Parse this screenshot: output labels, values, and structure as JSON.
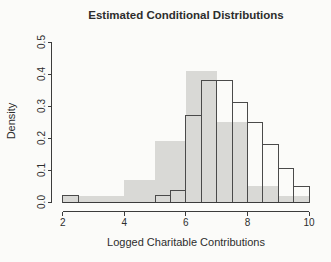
{
  "chart_data": {
    "type": "bar",
    "subtype": "overlaid-histograms",
    "title": "Estimated Conditional Distributions",
    "xlabel": "Logged Charitable Contributions",
    "ylabel": "Density",
    "xlim": [
      2,
      10
    ],
    "ylim": [
      0,
      0.5
    ],
    "x_ticks": [
      "2",
      "4",
      "6",
      "8",
      "10"
    ],
    "y_ticks": [
      "0.0",
      "0.1",
      "0.2",
      "0.3",
      "0.4",
      "0.5"
    ],
    "grid": "off",
    "legend": "none",
    "colors": {
      "shaded_fill": "#d9d9d6",
      "outline_stroke": "#4a4a4a",
      "axis": "#3c3c3c",
      "background": "#fbfbf9"
    },
    "series": [
      {
        "name": "shaded-histogram",
        "style": "filled",
        "bin_width": 1.0,
        "bins": [
          {
            "from": 2,
            "to": 3,
            "density": 0.02
          },
          {
            "from": 3,
            "to": 4,
            "density": 0.02
          },
          {
            "from": 4,
            "to": 5,
            "density": 0.07
          },
          {
            "from": 5,
            "to": 6,
            "density": 0.19
          },
          {
            "from": 6,
            "to": 7,
            "density": 0.41
          },
          {
            "from": 7,
            "to": 8,
            "density": 0.25
          },
          {
            "from": 8,
            "to": 9,
            "density": 0.05
          },
          {
            "from": 9,
            "to": 10,
            "density": 0.02
          }
        ]
      },
      {
        "name": "outlined-histogram",
        "style": "outline",
        "bin_width": 0.5,
        "bins": [
          {
            "from": 2.0,
            "to": 2.5,
            "density": 0.02
          },
          {
            "from": 5.0,
            "to": 5.5,
            "density": 0.02
          },
          {
            "from": 5.5,
            "to": 6.0,
            "density": 0.035
          },
          {
            "from": 6.0,
            "to": 6.5,
            "density": 0.27
          },
          {
            "from": 6.5,
            "to": 7.0,
            "density": 0.38
          },
          {
            "from": 7.0,
            "to": 7.5,
            "density": 0.38
          },
          {
            "from": 7.5,
            "to": 8.0,
            "density": 0.31
          },
          {
            "from": 8.0,
            "to": 8.5,
            "density": 0.25
          },
          {
            "from": 8.5,
            "to": 9.0,
            "density": 0.18
          },
          {
            "from": 9.0,
            "to": 9.5,
            "density": 0.105
          },
          {
            "from": 9.5,
            "to": 10.0,
            "density": 0.05
          }
        ]
      }
    ]
  }
}
